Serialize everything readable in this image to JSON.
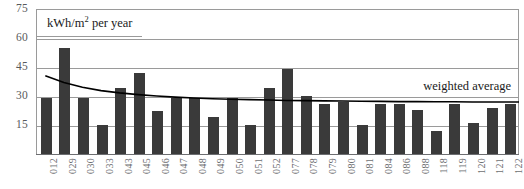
{
  "chart_data": {
    "type": "bar",
    "title": "",
    "subtitle": "",
    "unit_label": "kWh/m2 per year",
    "unit_label_prefix": "kWh/m",
    "unit_label_sup": "2",
    "unit_label_suffix": " per year",
    "xlabel": "",
    "ylabel": "",
    "ylim": [
      0,
      75
    ],
    "yticks": [
      75,
      60,
      45,
      30,
      15
    ],
    "grid": true,
    "legend_position": "inline-right",
    "categories": [
      "012",
      "029",
      "030",
      "033",
      "043",
      "045",
      "046",
      "047",
      "048",
      "049",
      "050",
      "051",
      "052",
      "077",
      "078",
      "079",
      "080",
      "081",
      "084",
      "086",
      "088",
      "118",
      "119",
      "120",
      "121",
      "122"
    ],
    "values": [
      29,
      55,
      29,
      15,
      34,
      42,
      22,
      29,
      29,
      19,
      29,
      15,
      34,
      44,
      30,
      26,
      27,
      15,
      26,
      26,
      23,
      12,
      26,
      16,
      24,
      26
    ],
    "series": [
      {
        "name": "kWh/m2 per year",
        "type": "bar",
        "color": "#3a3a3a",
        "values": [
          29,
          55,
          29,
          15,
          34,
          42,
          22,
          29,
          29,
          19,
          29,
          15,
          34,
          44,
          30,
          26,
          27,
          15,
          26,
          26,
          23,
          12,
          26,
          16,
          24,
          26
        ]
      },
      {
        "name": "weighted average",
        "type": "line",
        "color": "#000000",
        "values": [
          40.5,
          37.0,
          34.5,
          32.8,
          31.6,
          30.7,
          30.0,
          29.4,
          29.0,
          28.6,
          28.3,
          28.1,
          27.9,
          27.7,
          27.6,
          27.5,
          27.4,
          27.3,
          27.2,
          27.1,
          27.1,
          27.0,
          27.0,
          26.9,
          26.9,
          26.9
        ]
      }
    ],
    "annotations": [
      {
        "name": "weighted-average",
        "text": "weighted average",
        "position": "right"
      }
    ]
  },
  "axes": {
    "y": {
      "ticks": [
        {
          "label": "75",
          "value": 75
        },
        {
          "label": "60",
          "value": 60
        },
        {
          "label": "45",
          "value": 45
        },
        {
          "label": "30",
          "value": 30
        },
        {
          "label": "15",
          "value": 15
        }
      ]
    }
  },
  "colors": {
    "bar": "#3a3a3a",
    "gridline": "#9a9a9a",
    "axis": "#6d6e71",
    "trendline": "#000000",
    "tick_text": "#58595b",
    "label_text": "#1a1a1a",
    "background": "#ffffff"
  }
}
